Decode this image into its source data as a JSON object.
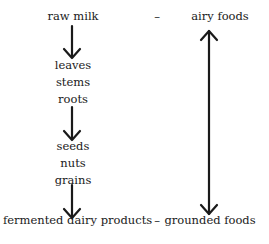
{
  "diagram": {
    "top_row": {
      "left": "raw milk",
      "dash": "–",
      "right": "airy foods"
    },
    "left_column": {
      "group1": [
        "leaves",
        "stems",
        "roots"
      ],
      "group2": [
        "seeds",
        "nuts",
        "grains"
      ]
    },
    "bottom_row": {
      "left": "fermented dairy products",
      "dash": "–",
      "right": "grounded foods"
    },
    "arrows": [
      {
        "from": "raw milk",
        "to": "leaves",
        "direction": "down"
      },
      {
        "from": "roots",
        "to": "seeds",
        "direction": "down"
      },
      {
        "from": "grains",
        "to": "fermented dairy products",
        "direction": "down"
      },
      {
        "between": [
          "airy foods",
          "grounded foods"
        ],
        "direction": "bidirectional"
      }
    ],
    "colors": {
      "ink": "#1a1a1a",
      "background": "#ffffff"
    }
  }
}
